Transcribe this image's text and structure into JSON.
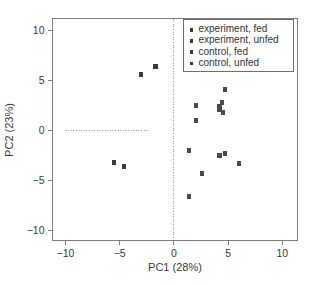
{
  "chart_data": {
    "type": "scatter",
    "title": "",
    "xlabel": "PC1 (28%)",
    "ylabel": "PC2 (23%)",
    "xlim": [
      -11.2,
      11.4
    ],
    "ylim": [
      -11.0,
      11.2
    ],
    "xticks": [
      "-10",
      "-5",
      "0",
      "5",
      "10"
    ],
    "xtick_values": [
      -10,
      -5,
      0,
      5,
      10
    ],
    "yticks": [
      "10",
      "5",
      "0",
      "-5",
      "-10"
    ],
    "ytick_values": [
      10,
      5,
      0,
      -5,
      -10
    ],
    "grid": false,
    "legend_position": "top-right",
    "reference_lines": [
      {
        "name": "vertical-zero-line",
        "orientation": "vertical",
        "value": 0,
        "style": "dotted",
        "from": -11.0,
        "to": 11.2
      },
      {
        "name": "horizontal-zero-line",
        "orientation": "horizontal",
        "value": 0,
        "style": "dotted",
        "from": -10.0,
        "to": -2.4
      }
    ],
    "legend": [
      {
        "label": "experiment, fed",
        "marker": "filled-square",
        "color": "#3a3a3a"
      },
      {
        "label": "experiment, unfed",
        "marker": "filled-square",
        "color": "#3a3a3a"
      },
      {
        "label": "control, fed",
        "marker": "filled-square",
        "color": "#3a3a3a"
      },
      {
        "label": "control, unfed",
        "marker": "filled-square",
        "color": "#3a3a3a"
      }
    ],
    "series": [
      {
        "name": "experiment, fed",
        "marker": "filled-square",
        "color": "#3a3a3a",
        "points": [
          {
            "x": -3.0,
            "y": 5.6
          },
          {
            "x": -1.7,
            "y": 6.4
          },
          {
            "x": -5.5,
            "y": -3.2
          },
          {
            "x": -4.6,
            "y": -3.6
          }
        ]
      },
      {
        "name": "experiment, unfed",
        "marker": "filled-square",
        "color": "#4a4a4a",
        "points": [
          {
            "x": 4.7,
            "y": 4.1
          },
          {
            "x": 2.0,
            "y": 2.5
          },
          {
            "x": 2.0,
            "y": 1.0
          },
          {
            "x": 4.4,
            "y": 2.8
          },
          {
            "x": 4.5,
            "y": 1.8
          },
          {
            "x": 4.2,
            "y": 2.4
          },
          {
            "x": 4.2,
            "y": 2.1
          }
        ]
      },
      {
        "name": "control, fed",
        "marker": "filled-square",
        "color": "#4a4a4a",
        "points": [
          {
            "x": 1.4,
            "y": -2.0
          },
          {
            "x": 4.2,
            "y": -2.5
          },
          {
            "x": 4.7,
            "y": -2.3
          },
          {
            "x": 6.0,
            "y": -3.3
          }
        ]
      },
      {
        "name": "control, unfed",
        "marker": "filled-square",
        "color": "#4a4a4a",
        "points": [
          {
            "x": 2.6,
            "y": -4.3
          },
          {
            "x": 1.4,
            "y": -6.6
          }
        ]
      }
    ]
  },
  "axes": {
    "x_title": "PC1 (28%)",
    "y_title": "PC2 (23%)"
  }
}
